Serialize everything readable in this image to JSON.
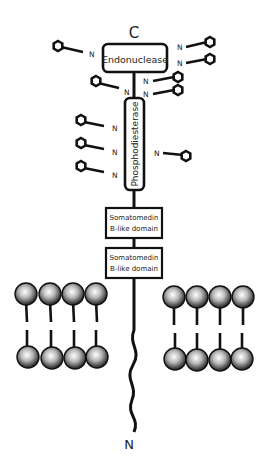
{
  "diagram": {
    "title": "",
    "termini": {
      "c_terminus": "C",
      "n_terminus": "N"
    },
    "domains": [
      {
        "id": "endonuclease",
        "label": "Endonuclease"
      },
      {
        "id": "phosphodiesterase",
        "label": "Phosphodiesterase"
      },
      {
        "id": "somatomedin_1",
        "line1": "Somatomedin",
        "line2": "B-like domain"
      },
      {
        "id": "somatomedin_2",
        "line1": "Somatomedin",
        "line2": "B-like domain"
      }
    ],
    "glycan_label": "N",
    "glycosylation_sites": 12,
    "membrane": {
      "lipids_left": 4,
      "lipids_right": 4
    },
    "colors": {
      "stroke": "#111111",
      "background": "#ffffff",
      "lipid_head": "#9a9a9a"
    }
  }
}
